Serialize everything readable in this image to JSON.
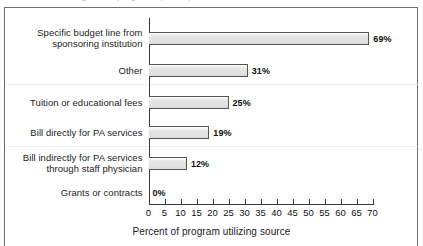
{
  "figure": {
    "top_partial_text": "Sources of funding for PA programs (cut off)",
    "frame_color": "#6e6e6e"
  },
  "chart_data": {
    "type": "bar",
    "orientation": "horizontal",
    "title": "",
    "xlabel": "Percent of program utilizing source",
    "ylabel": "",
    "xlim": [
      0,
      70
    ],
    "xticks": [
      0,
      5,
      10,
      15,
      20,
      25,
      30,
      35,
      40,
      45,
      50,
      55,
      60,
      65,
      70
    ],
    "xtick_labels": [
      "0",
      "5",
      "10",
      "15",
      "20",
      "25",
      "30",
      "35",
      "40",
      "45",
      "50",
      "55",
      "60",
      "65",
      "70"
    ],
    "grid": false,
    "legend": false,
    "bar_fill_color": "#e3e3e3",
    "bar_edge_color": "#555555",
    "categories": [
      "Specific budget line from\nsponsoring institution",
      "Other",
      "Tuition or educational fees",
      "Bill directly for PA services",
      "Bill indirectly for PA services\nthrough staff physician",
      "Grants or contracts"
    ],
    "values": [
      69,
      31,
      25,
      19,
      12,
      0
    ],
    "data_labels": [
      "69%",
      "31%",
      "25%",
      "19%",
      "12%",
      "0%"
    ]
  }
}
